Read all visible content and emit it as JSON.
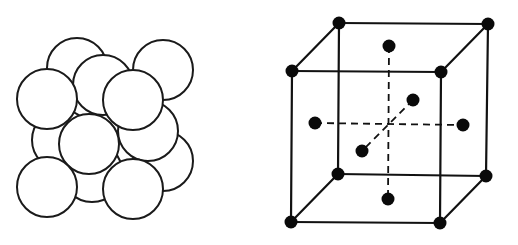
{
  "figure": {
    "left_panel": {
      "name": "close-packed-spheres",
      "sphere_radius": 30,
      "stroke_color": "#1a1a1a",
      "fill_color": "#ffffff",
      "spheres": [
        {
          "id": "back-top-left",
          "cx": 77,
          "cy": 68
        },
        {
          "id": "back-top-right",
          "cx": 163,
          "cy": 70
        },
        {
          "id": "mid-top-behind",
          "cx": 103,
          "cy": 85
        },
        {
          "id": "mid-left-behind",
          "cx": 62,
          "cy": 140
        },
        {
          "id": "right-lower-back",
          "cx": 163,
          "cy": 161
        },
        {
          "id": "bottom-mid-behind",
          "cx": 92,
          "cy": 172
        },
        {
          "id": "mid-right",
          "cx": 148,
          "cy": 131
        },
        {
          "id": "front-top-left",
          "cx": 47,
          "cy": 99
        },
        {
          "id": "front-top-right",
          "cx": 133,
          "cy": 100
        },
        {
          "id": "center",
          "cx": 89,
          "cy": 144
        },
        {
          "id": "bottom-left-front",
          "cx": 47,
          "cy": 187
        },
        {
          "id": "bottom-right-front",
          "cx": 133,
          "cy": 189
        }
      ]
    },
    "right_panel": {
      "name": "face-centered-cubic-unit-cell",
      "atom_radius": 6.5,
      "atom_color": "#0a0a0a",
      "corners": {
        "back_top_left": [
          339,
          23
        ],
        "back_top_right": [
          488,
          24
        ],
        "front_top_left": [
          292,
          71
        ],
        "front_top_right": [
          441,
          72
        ],
        "back_bottom_left": [
          338,
          174
        ],
        "back_bottom_right": [
          486,
          176
        ],
        "front_bottom_left": [
          291,
          222
        ],
        "front_bottom_right": [
          440,
          223
        ]
      },
      "face_centers": {
        "top": [
          389,
          46
        ],
        "bottom": [
          388,
          199
        ],
        "left": [
          315,
          123
        ],
        "right": [
          463,
          125
        ],
        "back": [
          413,
          100
        ],
        "front": [
          362,
          151
        ]
      },
      "center": [
        389,
        124
      ]
    }
  }
}
